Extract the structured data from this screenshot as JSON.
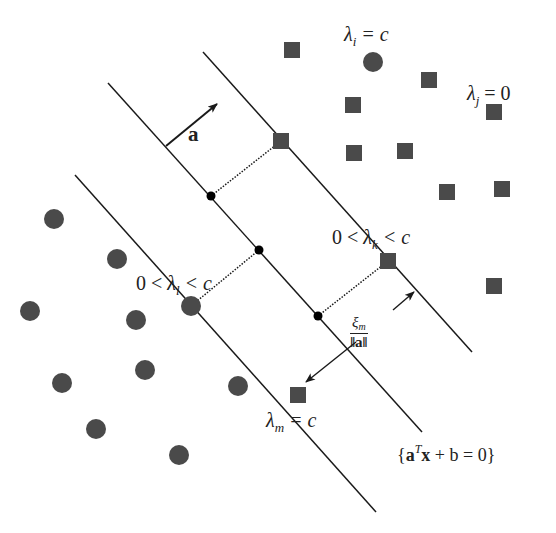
{
  "diagram": {
    "colors": {
      "point_fill": "#4a4a4a",
      "line": "#1a1a1a",
      "support_dot": "#000000",
      "background": "#ffffff"
    },
    "labels": {
      "normal_vector": "a",
      "lambda_i": {
        "sym": "λ",
        "sub": "i",
        "rest": " = c"
      },
      "lambda_j": {
        "sym": "λ",
        "sub": "j",
        "rest": " = 0"
      },
      "lambda_k": {
        "pre": "0 < ",
        "sym": "λ",
        "sub": "k",
        "rest": " < c"
      },
      "lambda_l": {
        "pre": "0 < ",
        "sym": "λ",
        "sub": "l",
        "rest": " < c"
      },
      "lambda_m": {
        "sym": "λ",
        "sub": "m",
        "rest": " = c"
      },
      "hyperplane": {
        "open": "{",
        "a": "a",
        "sup": "T",
        "x": "x",
        "rest": " + b = 0",
        "close": "}"
      },
      "slack": {
        "num_sym": "ξ",
        "num_sub": "m",
        "den": "‖a‖"
      }
    },
    "lines": {
      "upper_margin": {
        "x1": 203,
        "y1": 52,
        "x2": 472,
        "y2": 352
      },
      "hyperplane": {
        "x1": 108,
        "y1": 83,
        "x2": 422,
        "y2": 432
      },
      "lower_margin": {
        "x1": 75,
        "y1": 175,
        "x2": 376,
        "y2": 512
      }
    },
    "class_squares": [
      {
        "x": 292,
        "y": 50
      },
      {
        "x": 429,
        "y": 80
      },
      {
        "x": 353,
        "y": 105
      },
      {
        "x": 494,
        "y": 112
      },
      {
        "x": 281,
        "y": 141
      },
      {
        "x": 354,
        "y": 153
      },
      {
        "x": 405,
        "y": 151
      },
      {
        "x": 447,
        "y": 192
      },
      {
        "x": 502,
        "y": 189
      },
      {
        "x": 388,
        "y": 261
      },
      {
        "x": 494,
        "y": 286
      },
      {
        "x": 298,
        "y": 395
      }
    ],
    "class_circles": [
      {
        "x": 373,
        "y": 62
      },
      {
        "x": 54,
        "y": 219
      },
      {
        "x": 117,
        "y": 259
      },
      {
        "x": 30,
        "y": 311
      },
      {
        "x": 136,
        "y": 320
      },
      {
        "x": 191,
        "y": 306
      },
      {
        "x": 62,
        "y": 383
      },
      {
        "x": 145,
        "y": 370
      },
      {
        "x": 238,
        "y": 386
      },
      {
        "x": 96,
        "y": 429
      },
      {
        "x": 179,
        "y": 455
      }
    ],
    "projection_dots": [
      {
        "x": 211,
        "y": 196
      },
      {
        "x": 259,
        "y": 250
      },
      {
        "x": 318,
        "y": 316
      }
    ],
    "dotted_projections": [
      {
        "x1": 211,
        "y1": 196,
        "x2": 281,
        "y2": 141
      },
      {
        "x1": 259,
        "y1": 250,
        "x2": 191,
        "y2": 306
      },
      {
        "x1": 318,
        "y1": 316,
        "x2": 388,
        "y2": 261
      }
    ],
    "arrows": {
      "normal": {
        "x1": 166,
        "y1": 146,
        "x2": 217,
        "y2": 104
      },
      "slack_up": {
        "x1": 393,
        "y1": 310,
        "x2": 414,
        "y2": 292
      },
      "slack_down": {
        "x1": 356,
        "y1": 342,
        "x2": 306,
        "y2": 382
      }
    }
  }
}
